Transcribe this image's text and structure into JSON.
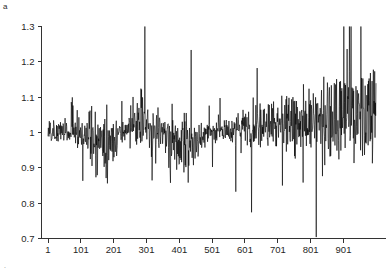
{
  "panel": {
    "label": "a",
    "corner_mark": "."
  },
  "chart_data": {
    "type": "line",
    "title": "",
    "xlabel": "",
    "ylabel": "",
    "xlim": [
      1,
      1000
    ],
    "ylim": [
      0.7,
      1.3
    ],
    "grid": false,
    "legend": null,
    "line_color": "#000000",
    "xticks": [
      1,
      101,
      201,
      301,
      401,
      501,
      601,
      701,
      801,
      901
    ],
    "xtick_labels": [
      "1",
      "101",
      "201",
      "301",
      "401",
      "501",
      "601",
      "701",
      "801",
      "901"
    ],
    "yticks": [
      0.7,
      0.8,
      0.9,
      1,
      1.1,
      1.2,
      1.3
    ],
    "ytick_labels": [
      "0.7",
      "0.8",
      "0.9",
      "1",
      "1.1",
      "1.2",
      "1.3"
    ],
    "series": [
      {
        "name": "series-1",
        "x_start": 1,
        "x_step": 1,
        "n": 1000,
        "mean_level": 1.0,
        "values": [
          1.0,
          0.992,
          1.014,
          0.983,
          1.021,
          0.996,
          0.977,
          1.018,
          1.004,
          0.986,
          1.026,
          0.998,
          0.972,
          1.012,
          1.031,
          0.99,
          0.968,
          1.008,
          1.024,
          0.995,
          0.981,
          1.016,
          1.002,
          0.974,
          1.019,
          1.035,
          0.993,
          0.966,
          1.01,
          1.027,
          0.999,
          0.978,
          1.021,
          1.006,
          0.985,
          1.03,
          1.013,
          0.971,
          1.004,
          1.038,
          0.996,
          0.963,
          1.015,
          1.029,
          0.991,
          0.976,
          1.018,
          1.007,
          0.982,
          1.033,
          1.011,
          0.969,
          1.002,
          1.041,
          0.994,
          0.958,
          1.012,
          1.036,
          0.997,
          0.973,
          1.024,
          1.009,
          0.979,
          1.045,
          1.018,
          0.961,
          1.005,
          1.052,
          1.021,
          0.968,
          1.03,
          1.075,
          1.11,
          1.16,
          1.198,
          1.14,
          1.085,
          1.042,
          1.01,
          0.972,
          0.948,
          0.985,
          1.02,
          0.998,
          0.964,
          1.032,
          1.012,
          0.975,
          1.046,
          1.019,
          0.958,
          0.996,
          1.038,
          1.008,
          0.966,
          1.025,
          1.05,
          0.989,
          0.943,
          1.002,
          1.03,
          0.975,
          0.948,
          1.015,
          1.042,
          0.982,
          0.935,
          0.998,
          1.028,
          0.962,
          0.921,
          0.985,
          1.02,
          0.958,
          0.908,
          0.972,
          1.012,
          0.946,
          0.895,
          0.96,
          1.005,
          0.938,
          0.882,
          0.952,
          0.998,
          0.93,
          0.876,
          0.944,
          0.992,
          0.925,
          0.87,
          0.938,
          0.986,
          0.918,
          0.862,
          0.932,
          0.98,
          0.912,
          0.856,
          0.926,
          0.975,
          0.906,
          0.848,
          0.92,
          0.968,
          0.9,
          0.842,
          0.915,
          0.962,
          0.895,
          0.838,
          0.908,
          0.958,
          0.89,
          0.832,
          0.902,
          0.952,
          0.885,
          0.826,
          0.898,
          0.948,
          0.88,
          0.82,
          0.892,
          0.945,
          0.876,
          0.815,
          0.888,
          0.94,
          0.872,
          0.812,
          0.885,
          0.938,
          0.868,
          0.808,
          0.882,
          0.935,
          0.865,
          0.818,
          0.89,
          0.942,
          0.872,
          0.825,
          0.898,
          0.95,
          0.88,
          0.835,
          0.905,
          0.958,
          0.89,
          0.845,
          0.915,
          0.968,
          0.902,
          0.858,
          0.928,
          0.978,
          0.915,
          0.87,
          0.94,
          0.988,
          0.928,
          0.885,
          0.952,
          0.996,
          0.94,
          0.898,
          0.962,
          1.004,
          0.952,
          0.912,
          0.972,
          1.012,
          0.962,
          0.925,
          0.982,
          1.02,
          0.972,
          0.938,
          0.992,
          1.028,
          0.982,
          0.95,
          1.0,
          1.035,
          0.992,
          0.962,
          1.008,
          1.042,
          1.0,
          0.972,
          1.016,
          1.048,
          1.008,
          0.982,
          1.022,
          1.054,
          1.014,
          0.99,
          1.028,
          1.058,
          1.02,
          0.996,
          1.032,
          1.062,
          1.025,
          1.002,
          1.036,
          1.066,
          1.03,
          1.006,
          1.04,
          1.07,
          1.034,
          1.01,
          1.045,
          1.078,
          1.04,
          1.014,
          1.052,
          1.088,
          1.048,
          1.018,
          1.06,
          1.1,
          1.056,
          1.022,
          1.07,
          1.115,
          1.065,
          1.028,
          1.082,
          1.13,
          1.075,
          1.032,
          1.095,
          1.15,
          1.088,
          1.036,
          1.11,
          1.175,
          1.1,
          1.04,
          1.125,
          1.198,
          1.112,
          1.042,
          1.14,
          1.185,
          1.095,
          1.03,
          1.108,
          1.16,
          1.075,
          1.02,
          1.085,
          1.14,
          1.06,
          1.008,
          1.066,
          1.12,
          1.045,
          0.998,
          1.05,
          1.105,
          1.032,
          0.988,
          1.038,
          1.092,
          1.02,
          0.978,
          1.028,
          1.08,
          1.01,
          0.968,
          1.018,
          1.068,
          1.0,
          0.958,
          1.008,
          1.175,
          1.09,
          1.0,
          0.948,
          1.0,
          1.155,
          1.07,
          0.99,
          0.94,
          0.995,
          1.135,
          1.055,
          0.982,
          0.932,
          0.988,
          1.115,
          1.04,
          0.975,
          0.925,
          0.98,
          1.095,
          1.025,
          0.968,
          0.918,
          0.972,
          1.072,
          1.01,
          0.96,
          0.91,
          0.962,
          1.05,
          0.995,
          0.952,
          0.902,
          0.952,
          1.028,
          0.98,
          0.944,
          0.894,
          0.942,
          1.008,
          0.968,
          0.936,
          0.886,
          0.932,
          0.99,
          0.956,
          0.928,
          0.878,
          0.922,
          0.975,
          0.946,
          0.92,
          0.87,
          0.912,
          0.96,
          0.936,
          0.912,
          0.862,
          0.902,
          0.948,
          0.926,
          0.905,
          0.856,
          0.895,
          0.938,
          0.918,
          0.898,
          0.85,
          0.888,
          0.93,
          0.91,
          0.892,
          0.845,
          0.882,
          0.922,
          0.904,
          0.886,
          0.84,
          0.876,
          0.916,
          0.898,
          0.88,
          0.836,
          0.872,
          0.91,
          0.892,
          0.875,
          0.832,
          0.868,
          0.906,
          0.888,
          0.872,
          0.828,
          0.864,
          0.902,
          0.885,
          0.87,
          0.826,
          0.862,
          0.9,
          0.884,
          0.868,
          0.824,
          0.86,
          0.9,
          0.886,
          0.872,
          0.83,
          0.868,
          0.908,
          0.894,
          0.88,
          0.84,
          0.878,
          0.918,
          0.904,
          0.892,
          0.852,
          0.89,
          0.93,
          0.918,
          0.906,
          0.866,
          0.904,
          0.944,
          0.932,
          0.92,
          0.882,
          0.918,
          0.958,
          0.946,
          0.934,
          0.898,
          0.932,
          0.97,
          0.958,
          0.948,
          0.912,
          0.944,
          0.98,
          0.97,
          0.96,
          0.926,
          0.956,
          0.99,
          0.98,
          0.97,
          0.938,
          0.966,
          0.998,
          0.988,
          0.98,
          0.948,
          0.975,
          1.004,
          0.996,
          0.988,
          0.958,
          0.982,
          1.01,
          1.002,
          0.994,
          0.966,
          0.988,
          1.014,
          1.006,
          1.0,
          0.972,
          0.994,
          1.018,
          1.01,
          1.004,
          0.978,
          0.998,
          1.022,
          1.014,
          1.008,
          0.982,
          1.002,
          1.024,
          1.016,
          1.01,
          0.986,
          1.004,
          1.026,
          1.018,
          1.012,
          0.988,
          1.006,
          1.028,
          1.02,
          1.014,
          0.99,
          1.008,
          1.03,
          1.022,
          1.016,
          0.992,
          1.01,
          1.032,
          1.024,
          1.018,
          0.994,
          1.012,
          1.034,
          1.026,
          1.02,
          0.996,
          1.014,
          1.036,
          1.028,
          1.022,
          0.998,
          1.016,
          1.038,
          1.03,
          1.024,
          1.0,
          1.018,
          1.04,
          1.032,
          1.026,
          1.002,
          1.02,
          1.042,
          1.034,
          1.028,
          1.004,
          1.022,
          1.044,
          1.036,
          1.03,
          1.006,
          1.024,
          1.046,
          1.038,
          1.032,
          1.008,
          1.026,
          1.048,
          1.04,
          1.034,
          1.01,
          1.028,
          1.05,
          1.042,
          1.036,
          1.012,
          1.03,
          1.052,
          1.044,
          1.038,
          1.014,
          1.032,
          1.054,
          1.046,
          1.04,
          1.016,
          1.034,
          1.056,
          1.048,
          1.042,
          1.018,
          1.036,
          1.058,
          1.05,
          1.044,
          1.02,
          1.038,
          1.06,
          1.052,
          1.046,
          1.022,
          1.04,
          1.062,
          1.054,
          1.048,
          1.024,
          1.042,
          1.064,
          1.056,
          1.05,
          1.026,
          1.044,
          1.066,
          1.058,
          1.052,
          1.028,
          1.046,
          1.068,
          1.06,
          1.054,
          1.03,
          1.048,
          1.07,
          1.062,
          1.056,
          1.032,
          1.05,
          1.072,
          1.064,
          1.058,
          1.034,
          1.052,
          1.074,
          1.066,
          1.06,
          1.036,
          1.054,
          1.076,
          1.068,
          1.062,
          1.038,
          1.056,
          1.078,
          1.07,
          1.064,
          1.04,
          1.058,
          1.08,
          1.072,
          1.066,
          1.042,
          1.06,
          1.082,
          1.074,
          1.068,
          1.044,
          1.062,
          1.084,
          1.076,
          1.07,
          1.046,
          1.064,
          1.086,
          1.078,
          1.072,
          1.048,
          1.066,
          1.088,
          1.08,
          1.074,
          1.05,
          1.068,
          1.09,
          1.082,
          1.076,
          1.052,
          1.07,
          1.092,
          1.084,
          1.078,
          1.054,
          1.072,
          1.094,
          1.086,
          1.08,
          1.056,
          1.074,
          1.096,
          1.088,
          1.082,
          1.058,
          1.076,
          1.098,
          1.09,
          1.084,
          1.06,
          1.078,
          1.1,
          1.092,
          1.086,
          1.062,
          1.08,
          1.102,
          1.094,
          1.088,
          1.064,
          1.082,
          1.104,
          1.096,
          1.09,
          1.066,
          1.084,
          1.106,
          1.098,
          1.092,
          1.068,
          1.086,
          1.108,
          1.1,
          1.094,
          1.07,
          1.088,
          1.11,
          1.102,
          1.096,
          1.072,
          1.09,
          1.112,
          1.104,
          1.098,
          1.074,
          1.092,
          1.114,
          1.106,
          1.1,
          1.076,
          1.094,
          1.116,
          1.108,
          1.102,
          1.078,
          1.096,
          1.118,
          1.11,
          1.104,
          1.08,
          1.098,
          1.12,
          1.112,
          1.106,
          1.082,
          1.1,
          1.122,
          1.114,
          1.108,
          1.084,
          1.102,
          1.124,
          1.116,
          1.11,
          1.086,
          1.104,
          1.126,
          1.118,
          1.112,
          1.088,
          1.106,
          1.128,
          1.12,
          1.114,
          1.09,
          1.108,
          1.13,
          1.122,
          1.116,
          1.092,
          1.11,
          1.132,
          1.124,
          1.118,
          1.094,
          1.112,
          1.134,
          1.126,
          1.12,
          1.096,
          1.114,
          1.136,
          1.128,
          1.122,
          1.098,
          1.116,
          1.138,
          1.13,
          1.124,
          1.1,
          1.118,
          1.14,
          1.132,
          1.126,
          1.102,
          1.12,
          1.142,
          1.134,
          1.128,
          1.104,
          1.122,
          1.144,
          1.136,
          1.13,
          1.106,
          1.124,
          1.146,
          1.138,
          1.132,
          1.108,
          1.126,
          1.148,
          1.14,
          1.134,
          1.11,
          1.128,
          1.15,
          1.142,
          1.136,
          1.112,
          1.13,
          1.152,
          1.144,
          1.138,
          1.114,
          1.132,
          1.154,
          1.146,
          1.14,
          1.116,
          1.134,
          1.156,
          1.148,
          1.142,
          1.118,
          1.136,
          1.158,
          1.15,
          1.144,
          1.12,
          1.138,
          1.16,
          1.152,
          1.146,
          1.122,
          1.14,
          1.162,
          1.154,
          1.148,
          1.124,
          1.142,
          1.164,
          1.156,
          1.15,
          1.126,
          1.144,
          1.166,
          1.158,
          1.152,
          1.128,
          1.146,
          1.168,
          1.16,
          1.154,
          1.13,
          1.148,
          1.17,
          1.162,
          1.156,
          1.132,
          1.15,
          1.172,
          1.164,
          1.158,
          1.134,
          1.152,
          1.174,
          1.166,
          1.16,
          1.136,
          1.154,
          1.176,
          1.168,
          1.162,
          1.138,
          1.156,
          1.178,
          1.17,
          1.164,
          1.14,
          1.158,
          1.18,
          1.172,
          1.166,
          1.142,
          1.16,
          1.182,
          1.174,
          1.168,
          1.144,
          1.162,
          1.184,
          1.176,
          1.17,
          1.146,
          1.164,
          1.186,
          1.178,
          1.172,
          1.148,
          1.166,
          1.188,
          1.18,
          1.174,
          1.15,
          1.168,
          1.19,
          1.182,
          1.176,
          1.152,
          1.17,
          1.192,
          1.184,
          1.178,
          1.154,
          1.172,
          1.194,
          1.186,
          1.18,
          1.156,
          1.174,
          1.196,
          1.188,
          1.182,
          1.158,
          1.176,
          1.198,
          1.19,
          1.184,
          1.16,
          1.178,
          1.2,
          1.192,
          1.186,
          1.162,
          1.18,
          1.202,
          1.194,
          1.188,
          1.164,
          1.182,
          1.204,
          1.196,
          1.19,
          1.166,
          1.184,
          1.206,
          1.198,
          1.192,
          1.168,
          1.186,
          1.208,
          1.2,
          1.194,
          1.17,
          1.188,
          1.21,
          1.202,
          1.196,
          1.172,
          1.19,
          1.212,
          1.204,
          1.198,
          1.174,
          1.192,
          1.214,
          1.206,
          1.2,
          1.176,
          1.194,
          1.216,
          1.208,
          1.202,
          1.178,
          1.196,
          1.218,
          1.21,
          1.204,
          1.18,
          1.198
        ]
      }
    ]
  }
}
